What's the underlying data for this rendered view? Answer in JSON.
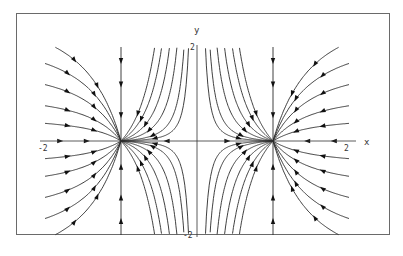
{
  "chart_data": {
    "type": "phase-portrait",
    "title": "",
    "xlabel": "x",
    "ylabel": "y",
    "xlim": [
      -2,
      2
    ],
    "ylim": [
      -2,
      2
    ],
    "x_ticks": [
      {
        "value": -2,
        "label": "-2"
      },
      {
        "value": 2,
        "label": "2"
      }
    ],
    "y_ticks": [
      {
        "value": 2,
        "label": "2"
      },
      {
        "value": -2,
        "label": "-2"
      }
    ],
    "equilibria": [
      {
        "x": -1,
        "y": 0,
        "type": "stable node"
      },
      {
        "x": 1,
        "y": 0,
        "type": "stable node"
      }
    ],
    "invariant_lines": [
      {
        "x": -1
      },
      {
        "x": 1
      },
      {
        "y": 0
      }
    ],
    "streamline_family": "y = C (x^2 - 1) / x^2",
    "outer_C": [
      -2.8,
      -2.2,
      -1.6,
      -1.0,
      -0.5,
      0.5,
      1.0,
      1.6,
      2.2,
      2.8
    ],
    "inner_C": [
      -0.9,
      -0.55,
      -0.3,
      -0.15,
      -0.06,
      -0.025,
      0.025,
      0.06,
      0.15,
      0.3,
      0.55,
      0.9
    ],
    "flow": "toward nodes at (-1,0) and (1,0)",
    "grid": false,
    "legend": null
  },
  "axes": {
    "x_label": "x",
    "y_label": "y",
    "x_min_label": "-2",
    "x_max_label": "2",
    "y_max_label": "2",
    "y_min_label": "-2"
  },
  "colors": {
    "curve": "#2a2a2a",
    "arrow": "#111111",
    "frame": "#6a6a6a",
    "axis": "#333333"
  }
}
